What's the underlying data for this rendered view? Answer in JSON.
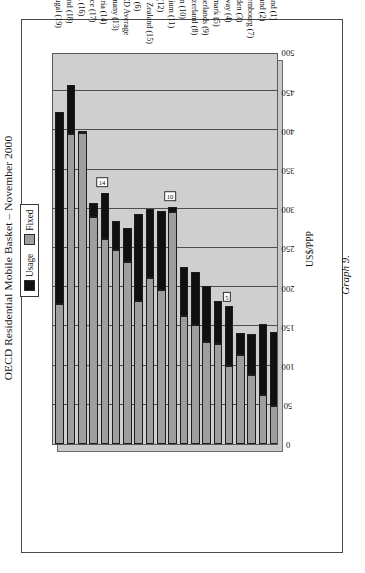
{
  "figure": {
    "caption": "Graph 9."
  },
  "chart_data": {
    "type": "bar",
    "subtype": "horizontal-stacked",
    "title": "OECD Residential Mobile Basket – November 2000",
    "xlabel": "US$/PPP",
    "ylabel": "",
    "xlim": [
      0,
      500
    ],
    "xticks": [
      0,
      50,
      100,
      150,
      200,
      250,
      300,
      350,
      400,
      450,
      500
    ],
    "grid": true,
    "legend_position": "top-center",
    "categories": [
      "Iceland (1)",
      "Finland (2)",
      "Luxembourg (7)",
      "Sweden (3)",
      "Norway (4)",
      "Denmark (5)",
      "Netherlands (9)",
      "Switzerland (8)",
      "Spain (10)",
      "Belgium (11)",
      "UK (12)",
      "New Zealand (15)",
      "Italy (6)",
      "OECD Average",
      "Germany (13)",
      "Austria (14)",
      "France (17)",
      "USA (16)",
      "Ireland (18)",
      "Portugal (19)"
    ],
    "series": [
      {
        "name": "Fixed",
        "color": "#9e9e9e",
        "values": [
          48,
          62,
          88,
          113,
          100,
          128,
          130,
          152,
          163,
          296,
          196,
          212,
          182,
          232,
          247,
          262,
          290,
          397,
          395,
          178
        ]
      },
      {
        "name": "Usage",
        "color": "#101010",
        "values": [
          95,
          91,
          52,
          28,
          76,
          54,
          71,
          67,
          63,
          6,
          101,
          88,
          112,
          43,
          38,
          58,
          17,
          0,
          63,
          245
        ]
      }
    ],
    "totals": [
      143,
      153,
      140,
      141,
      176,
      182,
      201,
      219,
      226,
      302,
      297,
      300,
      294,
      275,
      285,
      320,
      307,
      397,
      458,
      423
    ],
    "annotations": [
      {
        "text": "5",
        "category": "Norway (4)",
        "value": 176
      },
      {
        "text": "10",
        "category": "Belgium (11)",
        "value": 302
      },
      {
        "text": "14",
        "category": "Austria (14)",
        "value": 320
      }
    ]
  },
  "legend": {
    "items": [
      {
        "label": "Usage",
        "color": "#101010"
      },
      {
        "label": "Fixed",
        "color": "#9e9e9e"
      }
    ]
  }
}
